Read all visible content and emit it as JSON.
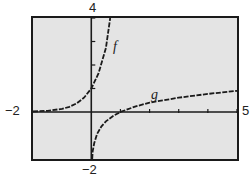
{
  "chart_data": {
    "type": "line",
    "title": "",
    "xlabel": "",
    "ylabel": "",
    "xlim": [
      -2,
      5
    ],
    "ylim": [
      -2,
      4
    ],
    "grid": false,
    "legend": "none (curves labeled inline)",
    "tick_labels": {
      "x_min": "−2",
      "x_max": "5",
      "y_min": "−2",
      "y_max": "4"
    },
    "x_ticks": [
      1,
      2,
      3,
      4,
      5
    ],
    "y_ticks": [
      1,
      2,
      3,
      4
    ],
    "series": [
      {
        "name": "f",
        "label": "f",
        "x": [
          -2,
          -1.5,
          -1,
          -0.75,
          -0.5,
          -0.25,
          0,
          0.25,
          0.5,
          0.65
        ],
        "y": [
          0.02,
          0.05,
          0.13,
          0.22,
          0.37,
          0.61,
          1.0,
          1.65,
          2.72,
          4.0
        ]
      },
      {
        "name": "g",
        "label": "g",
        "x": [
          0.03,
          0.05,
          0.1,
          0.2,
          0.35,
          0.5,
          0.75,
          1,
          1.5,
          2,
          3,
          4,
          5
        ],
        "y": [
          -2.0,
          -1.67,
          -1.33,
          -0.93,
          -0.61,
          -0.4,
          -0.17,
          0.0,
          0.23,
          0.4,
          0.61,
          0.77,
          0.9
        ]
      }
    ]
  },
  "labels": {
    "x_min": "−2",
    "x_max": "5",
    "y_min": "−2",
    "y_max": "4",
    "f": "f",
    "g": "g"
  },
  "colors": {
    "plot_bg": "#e4e4e4",
    "frame": "#1a1a1a",
    "curve": "#1a1a1a"
  }
}
